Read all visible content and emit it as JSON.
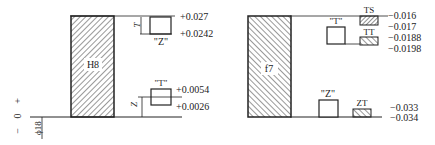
{
  "left": {
    "zone_label": "H8",
    "upper_gauge_label": "\"Z\"",
    "upper_gauge_dim": "T",
    "upper_values": [
      "+0.027",
      "+0.0242"
    ],
    "lower_gauge_label": "\"T\"",
    "lower_gauge_dim": "Z",
    "lower_values": [
      "+0.0054",
      "+0.0026"
    ],
    "axis_plus": "+",
    "axis_zero": "0",
    "axis_minus": "−",
    "diameter": "ϕ18"
  },
  "right": {
    "zone_label": "f7",
    "top_gauge_label": "\"T\"",
    "bottom_gauge_label": "\"Z\"",
    "ts_label": "TS",
    "tt_label": "TT",
    "zt_label": "ZT",
    "top_values": [
      "−0.016",
      "−0.017",
      "−0.0188",
      "−0.0198"
    ],
    "bottom_values": [
      "−0.033",
      "−0.034"
    ]
  }
}
